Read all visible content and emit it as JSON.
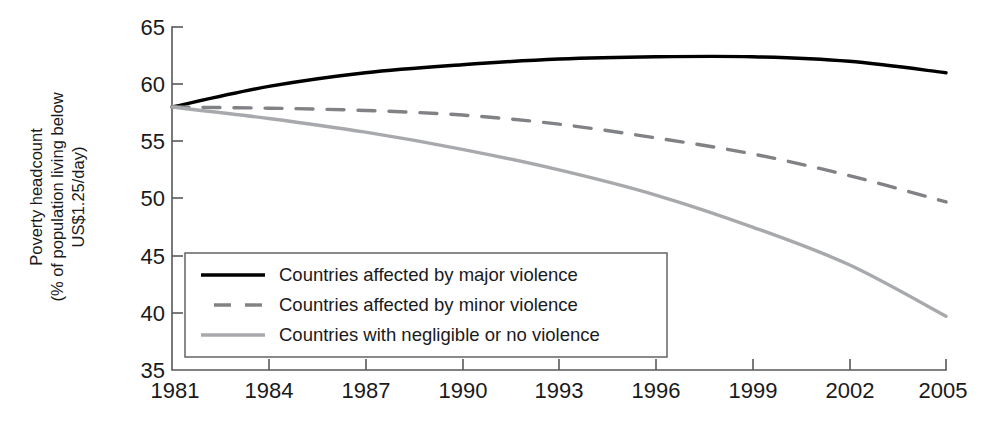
{
  "chart_data": {
    "type": "line",
    "title": "",
    "xlabel": "",
    "ylabel": "Poverty headcount (% of population living below US$1.25/day)",
    "ylabel_line1": "Poverty headcount",
    "ylabel_line2": "(% of population living below",
    "ylabel_line3": "US$1.25/day)",
    "x": [
      1981,
      1984,
      1987,
      1990,
      1993,
      1996,
      1999,
      2002,
      2005
    ],
    "xtick_labels": [
      "1981",
      "1984",
      "1987",
      "1990",
      "1993",
      "1996",
      "1999",
      "2002",
      "2005"
    ],
    "ytick_labels": [
      "65",
      "60",
      "55",
      "50",
      "45",
      "40",
      "35"
    ],
    "yticks": [
      65,
      60,
      55,
      50,
      45,
      40,
      35
    ],
    "xlim": [
      1981,
      2005
    ],
    "ylim": [
      35,
      65
    ],
    "grid": false,
    "legend_position": "lower-left-inside",
    "series": [
      {
        "name": "Countries affected by major violence",
        "style": "solid",
        "color": "#000000",
        "width": 3.4,
        "values": [
          58.0,
          59.8,
          61.0,
          61.7,
          62.2,
          62.4,
          62.4,
          62.0,
          61.0
        ]
      },
      {
        "name": "Countries affected by minor violence",
        "style": "dashed",
        "color": "#808285",
        "width": 3.4,
        "values": [
          58.0,
          57.9,
          57.7,
          57.3,
          56.5,
          55.3,
          53.9,
          52.0,
          49.7
        ]
      },
      {
        "name": "Countries with negligible or no violence",
        "style": "solid",
        "color": "#a7a9ac",
        "width": 3.4,
        "values": [
          58.0,
          57.0,
          55.8,
          54.3,
          52.5,
          50.3,
          47.5,
          44.2,
          39.7
        ]
      }
    ]
  },
  "legend": {
    "entries": [
      "Countries affected by major violence",
      "Countries affected by minor violence",
      "Countries with negligible or no violence"
    ]
  },
  "colors": {
    "major_violence": "#000000",
    "minor_violence": "#808285",
    "no_violence": "#a7a9ac",
    "axis": "#58595b",
    "text": "#1a1a1a",
    "background": "#ffffff"
  }
}
